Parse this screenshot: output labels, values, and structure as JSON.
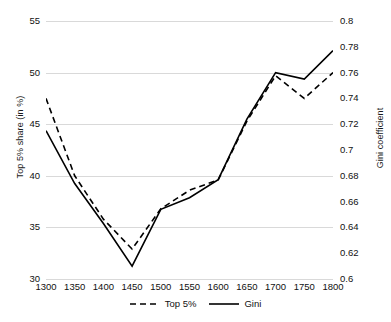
{
  "chart_data": {
    "type": "line",
    "title": "",
    "xlabel": "",
    "categories": [
      "1300",
      "1350",
      "1400",
      "1450",
      "1500",
      "1550",
      "1600",
      "1650",
      "1700",
      "1750",
      "1800"
    ],
    "grid": true,
    "legend_position": "bottom",
    "axes": {
      "left": {
        "label": "Top 5% share (in %)",
        "ticks": [
          "30",
          "35",
          "40",
          "45",
          "50",
          "55"
        ],
        "tick_values": [
          30,
          35,
          40,
          45,
          50,
          55
        ],
        "ylim": [
          30,
          55
        ]
      },
      "right": {
        "label": "Gini coefficient",
        "ticks": [
          "0.6",
          "0.62",
          "0.64",
          "0.66",
          "0.68",
          "0.7",
          "0.72",
          "0.74",
          "0.76",
          "0.78",
          "0.8"
        ],
        "tick_values": [
          0.6,
          0.62,
          0.64,
          0.66,
          0.68,
          0.7,
          0.72,
          0.74,
          0.76,
          0.78,
          0.8
        ],
        "ylim": [
          0.6,
          0.8
        ]
      }
    },
    "series": [
      {
        "name": "Top 5%",
        "axis": "left",
        "style": "dashed",
        "color": "#000000",
        "values": [
          47.5,
          40.0,
          35.8,
          32.9,
          36.8,
          38.6,
          39.6,
          45.3,
          49.7,
          47.5,
          50.0
        ]
      },
      {
        "name": "Gini",
        "axis": "right",
        "style": "solid",
        "color": "#000000",
        "values": [
          0.715,
          0.674,
          0.643,
          0.61,
          0.654,
          0.663,
          0.677,
          0.724,
          0.76,
          0.755,
          0.777
        ]
      }
    ]
  },
  "legend": {
    "items": [
      {
        "label": "Top 5%",
        "style": "dashed"
      },
      {
        "label": "Gini",
        "style": "solid"
      }
    ]
  }
}
